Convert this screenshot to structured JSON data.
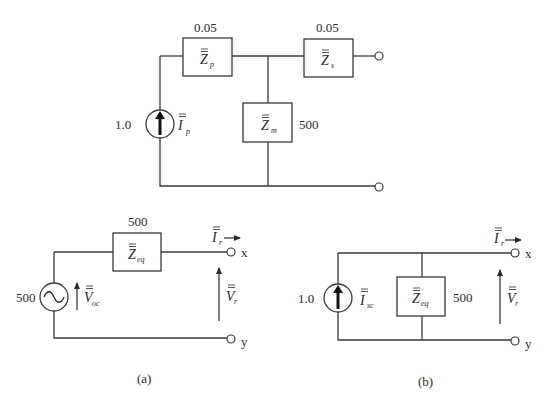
{
  "top_circuit": {
    "source": {
      "value": "1.0",
      "symbol": "I",
      "subscript": "p"
    },
    "Zp": {
      "value": "0.05",
      "symbol": "Z",
      "subscript": "p"
    },
    "Zs": {
      "value": "0.05",
      "symbol": "Z",
      "subscript": "s"
    },
    "Zm": {
      "value": "500",
      "symbol": "Z",
      "subscript": "m"
    }
  },
  "circuit_a": {
    "caption": "(a)",
    "source": {
      "value": "500",
      "symbol": "V",
      "subscript": "oc"
    },
    "Zeq": {
      "value": "500",
      "symbol": "Z",
      "subscript": "eq"
    },
    "current": {
      "symbol": "I",
      "subscript": "r"
    },
    "voltage": {
      "symbol": "V",
      "subscript": "r"
    },
    "terminal_top": "x",
    "terminal_bottom": "y"
  },
  "circuit_b": {
    "caption": "(b)",
    "source": {
      "value": "1.0",
      "symbol": "I",
      "subscript": "sc"
    },
    "Zeq": {
      "value": "500",
      "symbol": "Z",
      "subscript": "eq"
    },
    "current": {
      "symbol": "I",
      "subscript": "r"
    },
    "voltage": {
      "symbol": "V",
      "subscript": "r"
    },
    "terminal_top": "x",
    "terminal_bottom": "y"
  }
}
